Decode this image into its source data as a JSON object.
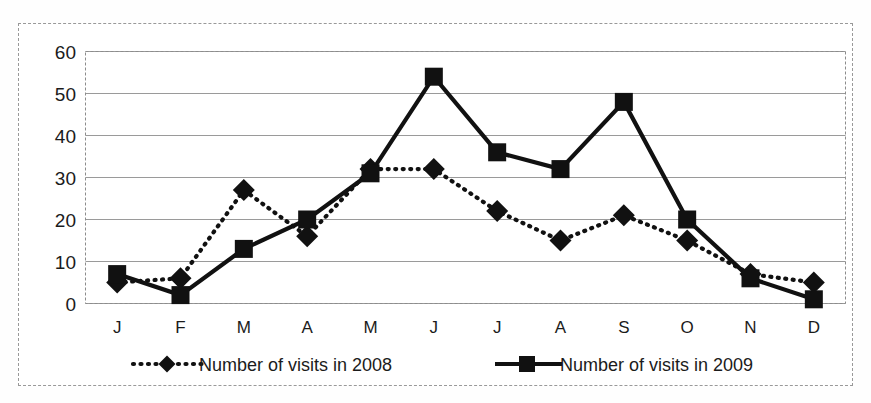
{
  "chart_data": {
    "type": "line",
    "title": "",
    "subtitle": "",
    "xlabel": "",
    "ylabel": "",
    "categories": [
      "J",
      "F",
      "M",
      "A",
      "M",
      "J",
      "J",
      "A",
      "S",
      "O",
      "N",
      "D"
    ],
    "category_names": [
      "January",
      "February",
      "March",
      "April",
      "May",
      "June",
      "July",
      "August",
      "September",
      "October",
      "November",
      "December"
    ],
    "series": [
      {
        "name": "Number of visits in 2008",
        "marker": "diamond",
        "line_style": "dotted",
        "color": "#111111",
        "values": [
          5,
          6,
          27,
          16,
          32,
          32,
          22,
          15,
          21,
          15,
          7,
          5
        ]
      },
      {
        "name": "Number of visits in 2009",
        "marker": "square",
        "line_style": "solid",
        "color": "#111111",
        "values": [
          7,
          2,
          13,
          20,
          31,
          54,
          36,
          32,
          48,
          20,
          6,
          1
        ]
      }
    ],
    "ylim": [
      0,
      60
    ],
    "yticks": [
      0,
      10,
      20,
      30,
      40,
      50,
      60
    ],
    "ytick_labels": [
      "0",
      "10",
      "20",
      "30",
      "40",
      "50",
      "60"
    ],
    "grid": true,
    "grid_axis": "y",
    "legend_position": "bottom",
    "legend": [
      {
        "label": "Number of visits in 2008",
        "marker": "diamond",
        "line_style": "dotted"
      },
      {
        "label": "Number of visits in 2009",
        "marker": "square",
        "line_style": "solid"
      }
    ]
  },
  "colors": {
    "background": "#ffffff",
    "frame": "#999999",
    "gridline": "#9a9a9a",
    "ink": "#111111",
    "text": "#1b1b1b"
  }
}
